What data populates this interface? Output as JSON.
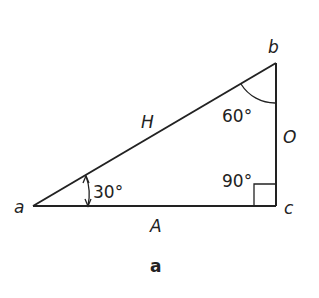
{
  "figure": {
    "caption": "a",
    "colors": {
      "stroke": "#222222",
      "background": "#ffffff"
    },
    "vertices": {
      "a": {
        "label": "a",
        "x": 33,
        "y": 206
      },
      "b": {
        "label": "b",
        "x": 276,
        "y": 63
      },
      "c": {
        "label": "c",
        "x": 276,
        "y": 206
      }
    },
    "sides": {
      "hypotenuse": {
        "label": "H"
      },
      "opposite": {
        "label": "O"
      },
      "adjacent": {
        "label": "A"
      }
    },
    "angles": {
      "at_a": {
        "label": "30°",
        "value": 30
      },
      "at_b": {
        "label": "60°",
        "value": 60
      },
      "at_c": {
        "label": "90°",
        "value": 90
      }
    }
  }
}
